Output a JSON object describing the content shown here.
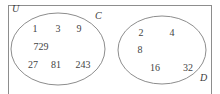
{
  "figure": {
    "type": "venn-diagram",
    "universe_label": "U",
    "stroke_color": "#8d8d8d",
    "text_color": "#434343",
    "background_color": "#ffffff"
  },
  "sets": [
    {
      "key": "left",
      "label": "C",
      "label_position": "top-right-outside",
      "members": [
        "1",
        "3",
        "9",
        "729",
        "27",
        "81",
        "243"
      ],
      "rows": [
        {
          "values": [
            "1",
            "3",
            "9"
          ]
        },
        {
          "values": [
            "729"
          ]
        },
        {
          "values": [
            "27",
            "81",
            "243"
          ]
        }
      ]
    },
    {
      "key": "right",
      "label": "D",
      "label_position": "bottom-right-outside",
      "members": [
        "2",
        "4",
        "8",
        "16",
        "32"
      ],
      "rows": [
        {
          "values": [
            "2",
            "4"
          ]
        },
        {
          "values": [
            "8"
          ]
        },
        {
          "values": [
            "16",
            "32"
          ]
        }
      ]
    }
  ],
  "members_positioned": [
    {
      "text": "1",
      "x": 35,
      "y": 29,
      "set": "C"
    },
    {
      "text": "3",
      "x": 58,
      "y": 29,
      "set": "C"
    },
    {
      "text": "9",
      "x": 79,
      "y": 29,
      "set": "C"
    },
    {
      "text": "729",
      "x": 41,
      "y": 47,
      "set": "C"
    },
    {
      "text": "27",
      "x": 33,
      "y": 65,
      "set": "C"
    },
    {
      "text": "81",
      "x": 56,
      "y": 65,
      "set": "C"
    },
    {
      "text": "243",
      "x": 83,
      "y": 65,
      "set": "C"
    },
    {
      "text": "2",
      "x": 141,
      "y": 33,
      "set": "D"
    },
    {
      "text": "4",
      "x": 172,
      "y": 33,
      "set": "D"
    },
    {
      "text": "8",
      "x": 140,
      "y": 50,
      "set": "D"
    },
    {
      "text": "16",
      "x": 155,
      "y": 68,
      "set": "D"
    },
    {
      "text": "32",
      "x": 188,
      "y": 68,
      "set": "D"
    }
  ],
  "ellipses": [
    {
      "key": "left",
      "cx": 58,
      "cy": 49,
      "rx": 47,
      "ry": 36
    },
    {
      "key": "right",
      "cx": 162,
      "cy": 50,
      "rx": 44,
      "ry": 34
    }
  ]
}
